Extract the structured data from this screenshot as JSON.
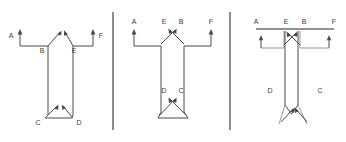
{
  "figure": {
    "kind": "engineering-free-body-diagrams",
    "panel_count": 3,
    "width": 346,
    "height": 142,
    "background_color": "#ffffff",
    "line_color": "#4a4a4a",
    "label_color": "#3a3a3a",
    "divider_color": "#2e2e2e",
    "bar_color": "#6b6b6b"
  },
  "panels": [
    {
      "id": "panel-1",
      "name": "left-diagram",
      "description": "T-shaped member with upward arrows at outer ends and crossing upward arrows at the web junction; chamfered base with V notch",
      "labels": [
        {
          "text": "A",
          "x": 11,
          "y": 36,
          "anchor": "arrow-left-end"
        },
        {
          "text": "B",
          "x": 42,
          "y": 50,
          "anchor": "web-left-top"
        },
        {
          "text": "E",
          "x": 74,
          "y": 50,
          "anchor": "web-right-top"
        },
        {
          "text": "F",
          "x": 101,
          "y": 36,
          "anchor": "arrow-right-end"
        },
        {
          "text": "C",
          "x": 38,
          "y": 122,
          "anchor": "base-left"
        },
        {
          "text": "D",
          "x": 79,
          "y": 122,
          "anchor": "base-right"
        }
      ],
      "arrows": [
        {
          "name": "arrow-A",
          "direction": "up",
          "x": 20,
          "from_y": 46,
          "to_y": 30
        },
        {
          "name": "arrow-F",
          "direction": "up",
          "x": 93,
          "from_y": 46,
          "to_y": 30
        },
        {
          "name": "arrow-B",
          "direction": "up-right",
          "x1": 48,
          "y1": 47,
          "x2": 61,
          "y2": 31
        },
        {
          "name": "arrow-E",
          "direction": "up-left",
          "x1": 73,
          "y1": 47,
          "x2": 64,
          "y2": 31
        },
        {
          "name": "arrow-C",
          "direction": "up-right",
          "x1": 45,
          "y1": 117,
          "x2": 57,
          "y2": 104
        },
        {
          "name": "arrow-D",
          "direction": "up-left",
          "x1": 72,
          "y1": 117,
          "x2": 62,
          "y2": 104
        }
      ]
    },
    {
      "id": "panel-2",
      "name": "middle-diagram",
      "description": "T-shaped member with labels above the load arrows; arrow pairs cross in an X at the top flange junction and again near the base",
      "labels": [
        {
          "text": "A",
          "x": 134,
          "y": 22,
          "anchor": "arrow-left-end"
        },
        {
          "text": "E",
          "x": 164,
          "y": 22,
          "anchor": "cross-left"
        },
        {
          "text": "B",
          "x": 181,
          "y": 22,
          "anchor": "cross-right"
        },
        {
          "text": "F",
          "x": 211,
          "y": 22,
          "anchor": "arrow-right-end"
        },
        {
          "text": "D",
          "x": 164,
          "y": 91,
          "anchor": "base-cross-left"
        },
        {
          "text": "C",
          "x": 181,
          "y": 91,
          "anchor": "base-cross-right"
        }
      ],
      "arrows": [
        {
          "name": "arrow-A",
          "direction": "up",
          "x": 134,
          "from_y": 46,
          "to_y": 29
        },
        {
          "name": "arrow-F",
          "direction": "up",
          "x": 211,
          "from_y": 46,
          "to_y": 29
        },
        {
          "name": "arrow-E",
          "direction": "up-right",
          "x1": 161,
          "y1": 44,
          "x2": 176,
          "y2": 28
        },
        {
          "name": "arrow-B",
          "direction": "up-left",
          "x1": 184,
          "y1": 44,
          "x2": 169,
          "y2": 28
        },
        {
          "name": "arrow-D",
          "direction": "up-right",
          "x1": 161,
          "y1": 114,
          "x2": 176,
          "y2": 97
        },
        {
          "name": "arrow-C",
          "direction": "up-left",
          "x1": 184,
          "y1": 114,
          "x2": 169,
          "y2": 97
        }
      ]
    },
    {
      "id": "panel-3",
      "name": "right-diagram",
      "description": "Narrow inner web inside a wide flange bar; outer upward arrows plus crossing arrows at top, splayed crossing arrows at the base, D and C label the web sides",
      "labels": [
        {
          "text": "A",
          "x": 256,
          "y": 22,
          "anchor": "arrow-left-end"
        },
        {
          "text": "E",
          "x": 286,
          "y": 22,
          "anchor": "cross-left"
        },
        {
          "text": "B",
          "x": 304,
          "y": 22,
          "anchor": "cross-right"
        },
        {
          "text": "F",
          "x": 334,
          "y": 22,
          "anchor": "arrow-right-end"
        },
        {
          "text": "D",
          "x": 270,
          "y": 91,
          "anchor": "web-left-side"
        },
        {
          "text": "C",
          "x": 320,
          "y": 91,
          "anchor": "web-right-side"
        }
      ],
      "arrows": [
        {
          "name": "arrow-A",
          "direction": "up",
          "x": 261,
          "from_y": 48,
          "to_y": 36
        },
        {
          "name": "arrow-F",
          "direction": "up",
          "x": 329,
          "from_y": 48,
          "to_y": 36
        },
        {
          "name": "arrow-E",
          "direction": "up-right",
          "x1": 284,
          "y1": 46,
          "x2": 297,
          "y2": 32
        },
        {
          "name": "arrow-B",
          "direction": "up-left",
          "x1": 300,
          "y1": 46,
          "x2": 288,
          "y2": 32
        },
        {
          "name": "arrow-D",
          "direction": "up-right",
          "x1": 281,
          "y1": 122,
          "x2": 294,
          "y2": 107
        },
        {
          "name": "arrow-C",
          "direction": "up-left",
          "x1": 307,
          "y1": 122,
          "x2": 295,
          "y2": 107
        }
      ],
      "flange_bar": {
        "x1": 256,
        "x2": 334,
        "y": 29
      }
    }
  ],
  "dividers": [
    {
      "name": "divider-1",
      "x": 113,
      "y1": 12,
      "y2": 130
    },
    {
      "name": "divider-2",
      "x": 230,
      "y1": 12,
      "y2": 130
    }
  ]
}
